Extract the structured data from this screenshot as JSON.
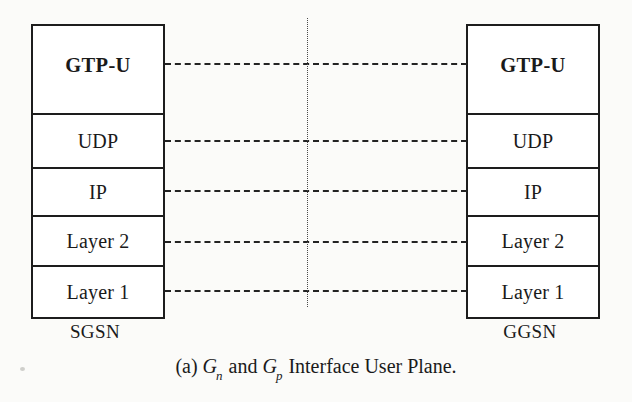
{
  "figure": {
    "caption_prefix": "(a)",
    "caption_var1": "G",
    "caption_var1_sub": "n",
    "caption_conjunction": "and",
    "caption_var2": "G",
    "caption_var2_sub": "p",
    "caption_suffix": "Interface User Plane.",
    "caption_full": "(a) Gn and Gp Interface User Plane."
  },
  "colors": {
    "box_border": "#1d1d1d",
    "link_dash": "#232323",
    "divider_dot": "#4a4a4a",
    "paper": "#fbfbf9",
    "box_fill": "#ffffff",
    "text": "#1a1a1a"
  },
  "nodes": {
    "left": {
      "name": "SGSN",
      "layers": [
        {
          "label": "GTP-U",
          "emphasis": "bold"
        },
        {
          "label": "UDP",
          "emphasis": "normal"
        },
        {
          "label": "IP",
          "emphasis": "normal"
        },
        {
          "label": "Layer 2",
          "emphasis": "normal"
        },
        {
          "label": "Layer 1",
          "emphasis": "normal"
        }
      ]
    },
    "right": {
      "name": "GGSN",
      "layers": [
        {
          "label": "GTP-U",
          "emphasis": "bold"
        },
        {
          "label": "UDP",
          "emphasis": "normal"
        },
        {
          "label": "IP",
          "emphasis": "normal"
        },
        {
          "label": "Layer 2",
          "emphasis": "normal"
        },
        {
          "label": "Layer 1",
          "emphasis": "normal"
        }
      ]
    }
  },
  "peer_links": [
    {
      "layer": "GTP-U",
      "style": "dashed"
    },
    {
      "layer": "UDP",
      "style": "dashed"
    },
    {
      "layer": "IP",
      "style": "dashed"
    },
    {
      "layer": "Layer 2",
      "style": "dashed"
    },
    {
      "layer": "Layer 1",
      "style": "dashed"
    }
  ],
  "divider": {
    "style": "dotted",
    "orientation": "vertical"
  }
}
